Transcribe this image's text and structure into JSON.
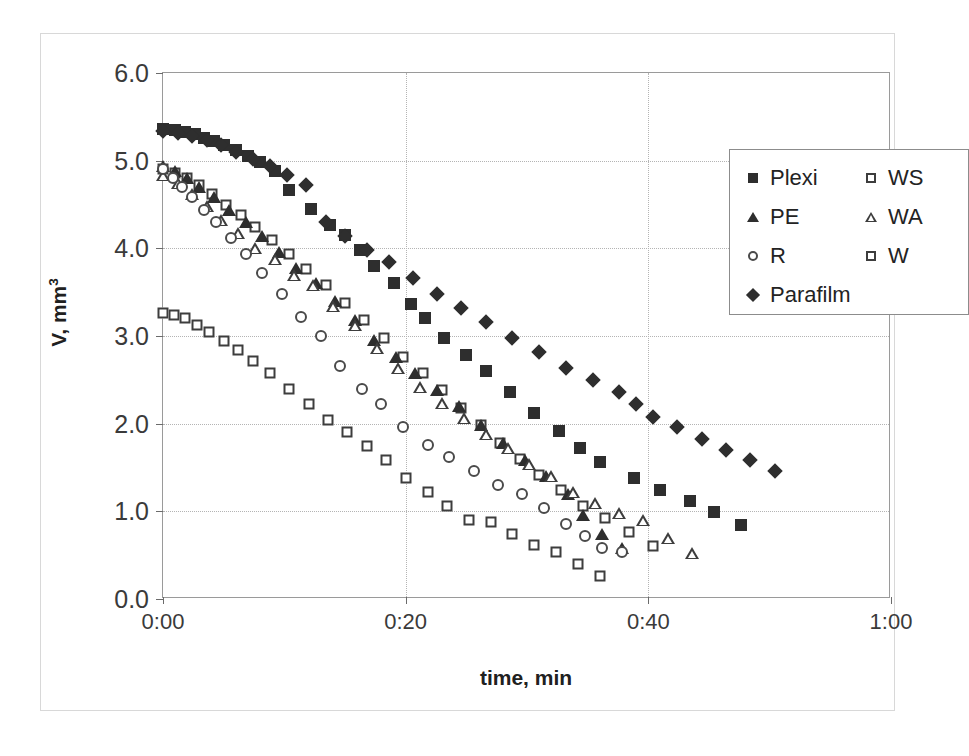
{
  "chart_data": {
    "type": "scatter",
    "title": "",
    "xlabel": "time, min",
    "ylabel": "V, mm3",
    "ylabel_display": "V, mm",
    "ylabel_sup": "3",
    "xlim": [
      0,
      60
    ],
    "ylim": [
      0.0,
      6.0
    ],
    "grid": true,
    "legend_position": "top-right",
    "xtick_labels": [
      "0:00",
      "0:20",
      "0:40",
      "1:00"
    ],
    "xtick_values": [
      0,
      20,
      40,
      60
    ],
    "ytick_labels": [
      "0.0",
      "1.0",
      "2.0",
      "3.0",
      "4.0",
      "5.0",
      "6.0"
    ],
    "ytick_values": [
      0.0,
      1.0,
      2.0,
      3.0,
      4.0,
      5.0,
      6.0
    ],
    "series": [
      {
        "name": "Plexi",
        "marker": "square-filled",
        "color": "#2e2e2e",
        "points": [
          [
            0.0,
            5.36
          ],
          [
            1.0,
            5.35
          ],
          [
            1.8,
            5.33
          ],
          [
            2.6,
            5.3
          ],
          [
            3.4,
            5.26
          ],
          [
            4.2,
            5.22
          ],
          [
            5.0,
            5.18
          ],
          [
            6.0,
            5.12
          ],
          [
            7.0,
            5.05
          ],
          [
            8.0,
            4.98
          ],
          [
            9.2,
            4.88
          ],
          [
            10.4,
            4.66
          ],
          [
            12.2,
            4.45
          ],
          [
            13.8,
            4.27
          ],
          [
            15.0,
            4.15
          ],
          [
            16.2,
            3.98
          ],
          [
            17.4,
            3.8
          ],
          [
            19.0,
            3.6
          ],
          [
            20.4,
            3.36
          ],
          [
            21.6,
            3.2
          ],
          [
            23.2,
            2.98
          ],
          [
            25.0,
            2.78
          ],
          [
            26.6,
            2.6
          ],
          [
            28.6,
            2.36
          ],
          [
            30.6,
            2.12
          ],
          [
            32.6,
            1.92
          ],
          [
            34.4,
            1.72
          ],
          [
            36.0,
            1.56
          ],
          [
            38.8,
            1.38
          ],
          [
            41.0,
            1.24
          ],
          [
            43.4,
            1.12
          ],
          [
            45.4,
            0.99
          ],
          [
            47.6,
            0.84
          ]
        ]
      },
      {
        "name": "WS",
        "marker": "square-open",
        "color": "#3d3d3d",
        "points": [
          [
            0.0,
            4.9
          ],
          [
            1.0,
            4.86
          ],
          [
            2.0,
            4.8
          ],
          [
            3.0,
            4.72
          ],
          [
            4.0,
            4.62
          ],
          [
            5.2,
            4.5
          ],
          [
            6.4,
            4.38
          ],
          [
            7.6,
            4.24
          ],
          [
            9.0,
            4.1
          ],
          [
            10.4,
            3.94
          ],
          [
            11.8,
            3.76
          ],
          [
            13.4,
            3.58
          ],
          [
            15.0,
            3.38
          ],
          [
            16.6,
            3.18
          ],
          [
            18.2,
            2.98
          ],
          [
            19.8,
            2.76
          ],
          [
            21.4,
            2.58
          ],
          [
            23.0,
            2.38
          ],
          [
            24.6,
            2.18
          ],
          [
            26.2,
            1.98
          ],
          [
            27.8,
            1.78
          ],
          [
            29.4,
            1.6
          ],
          [
            31.0,
            1.42
          ],
          [
            32.8,
            1.24
          ],
          [
            34.6,
            1.06
          ],
          [
            36.4,
            0.92
          ],
          [
            38.4,
            0.76
          ],
          [
            40.4,
            0.6
          ]
        ]
      },
      {
        "name": "PE",
        "marker": "triangle-filled",
        "color": "#2e2e2e",
        "points": [
          [
            0.0,
            4.94
          ],
          [
            1.0,
            4.88
          ],
          [
            2.0,
            4.8
          ],
          [
            3.0,
            4.7
          ],
          [
            4.2,
            4.58
          ],
          [
            5.4,
            4.44
          ],
          [
            6.8,
            4.3
          ],
          [
            8.2,
            4.14
          ],
          [
            9.6,
            3.96
          ],
          [
            11.0,
            3.78
          ],
          [
            12.6,
            3.6
          ],
          [
            14.2,
            3.4
          ],
          [
            15.8,
            3.18
          ],
          [
            17.4,
            2.96
          ],
          [
            19.2,
            2.76
          ],
          [
            20.8,
            2.58
          ],
          [
            22.6,
            2.38
          ],
          [
            24.4,
            2.2
          ],
          [
            26.2,
            1.98
          ],
          [
            28.0,
            1.78
          ],
          [
            29.8,
            1.58
          ],
          [
            31.6,
            1.4
          ],
          [
            33.4,
            1.2
          ],
          [
            34.6,
            0.96
          ],
          [
            36.2,
            0.74
          ],
          [
            37.8,
            0.58
          ]
        ]
      },
      {
        "name": "WA",
        "marker": "triangle-open",
        "color": "#3d3d3d",
        "points": [
          [
            0.0,
            4.84
          ],
          [
            1.2,
            4.74
          ],
          [
            2.4,
            4.62
          ],
          [
            3.6,
            4.48
          ],
          [
            4.8,
            4.32
          ],
          [
            6.2,
            4.18
          ],
          [
            7.6,
            4.0
          ],
          [
            9.2,
            3.88
          ],
          [
            10.8,
            3.7
          ],
          [
            12.4,
            3.58
          ],
          [
            14.0,
            3.34
          ],
          [
            15.8,
            3.12
          ],
          [
            17.6,
            2.86
          ],
          [
            19.4,
            2.64
          ],
          [
            21.2,
            2.42
          ],
          [
            23.0,
            2.24
          ],
          [
            24.8,
            2.06
          ],
          [
            26.6,
            1.88
          ],
          [
            28.4,
            1.72
          ],
          [
            30.2,
            1.54
          ],
          [
            32.0,
            1.4
          ],
          [
            33.8,
            1.22
          ],
          [
            35.6,
            1.1
          ],
          [
            37.6,
            0.98
          ],
          [
            39.6,
            0.9
          ],
          [
            41.6,
            0.7
          ],
          [
            43.6,
            0.52
          ]
        ]
      },
      {
        "name": "R",
        "marker": "circle-open",
        "color": "#4a4a4a",
        "points": [
          [
            0.0,
            4.9
          ],
          [
            0.8,
            4.8
          ],
          [
            1.6,
            4.7
          ],
          [
            2.4,
            4.58
          ],
          [
            3.4,
            4.44
          ],
          [
            4.4,
            4.3
          ],
          [
            5.6,
            4.12
          ],
          [
            6.8,
            3.94
          ],
          [
            8.2,
            3.72
          ],
          [
            9.8,
            3.48
          ],
          [
            11.4,
            3.22
          ],
          [
            13.0,
            3.0
          ],
          [
            14.6,
            2.66
          ],
          [
            16.4,
            2.4
          ],
          [
            18.0,
            2.22
          ],
          [
            19.8,
            1.96
          ],
          [
            21.8,
            1.76
          ],
          [
            23.6,
            1.62
          ],
          [
            25.6,
            1.46
          ],
          [
            27.6,
            1.3
          ],
          [
            29.6,
            1.2
          ],
          [
            31.4,
            1.04
          ],
          [
            33.2,
            0.86
          ],
          [
            34.8,
            0.72
          ],
          [
            36.2,
            0.58
          ],
          [
            37.8,
            0.54
          ]
        ]
      },
      {
        "name": "W",
        "marker": "square-open",
        "color": "#3d3d3d",
        "points": [
          [
            0.0,
            3.26
          ],
          [
            0.9,
            3.24
          ],
          [
            1.8,
            3.2
          ],
          [
            2.8,
            3.12
          ],
          [
            3.8,
            3.04
          ],
          [
            5.0,
            2.94
          ],
          [
            6.2,
            2.84
          ],
          [
            7.4,
            2.72
          ],
          [
            8.8,
            2.58
          ],
          [
            10.4,
            2.4
          ],
          [
            12.0,
            2.22
          ],
          [
            13.6,
            2.04
          ],
          [
            15.2,
            1.9
          ],
          [
            16.8,
            1.74
          ],
          [
            18.4,
            1.58
          ],
          [
            20.0,
            1.38
          ],
          [
            21.8,
            1.22
          ],
          [
            23.4,
            1.06
          ],
          [
            25.2,
            0.9
          ],
          [
            27.0,
            0.88
          ],
          [
            28.8,
            0.74
          ],
          [
            30.6,
            0.62
          ],
          [
            32.4,
            0.54
          ],
          [
            34.2,
            0.4
          ],
          [
            36.0,
            0.26
          ]
        ]
      },
      {
        "name": "Parafilm",
        "marker": "diamond-filled",
        "color": "#2e2e2e",
        "points": [
          [
            0.0,
            5.34
          ],
          [
            1.2,
            5.32
          ],
          [
            2.4,
            5.28
          ],
          [
            3.6,
            5.24
          ],
          [
            4.8,
            5.18
          ],
          [
            6.0,
            5.1
          ],
          [
            7.4,
            5.02
          ],
          [
            8.8,
            4.94
          ],
          [
            10.2,
            4.84
          ],
          [
            11.8,
            4.72
          ],
          [
            13.4,
            4.3
          ],
          [
            15.0,
            4.14
          ],
          [
            16.8,
            3.98
          ],
          [
            18.6,
            3.84
          ],
          [
            20.6,
            3.66
          ],
          [
            22.6,
            3.48
          ],
          [
            24.6,
            3.32
          ],
          [
            26.6,
            3.16
          ],
          [
            28.8,
            2.98
          ],
          [
            31.0,
            2.82
          ],
          [
            33.2,
            2.64
          ],
          [
            35.4,
            2.5
          ],
          [
            37.6,
            2.36
          ],
          [
            39.0,
            2.22
          ],
          [
            40.4,
            2.08
          ],
          [
            42.4,
            1.96
          ],
          [
            44.4,
            1.82
          ],
          [
            46.4,
            1.7
          ],
          [
            48.4,
            1.58
          ],
          [
            50.4,
            1.46
          ]
        ]
      }
    ]
  },
  "legend": {
    "left_column": [
      {
        "label": "Plexi",
        "marker": "square-filled"
      },
      {
        "label": "PE",
        "marker": "triangle-filled"
      },
      {
        "label": "R",
        "marker": "circle-open"
      },
      {
        "label": "Parafilm",
        "marker": "diamond-filled"
      }
    ],
    "right_column": [
      {
        "label": "WS",
        "marker": "square-open"
      },
      {
        "label": "WA",
        "marker": "triangle-open"
      },
      {
        "label": "W",
        "marker": "square-open"
      }
    ]
  }
}
